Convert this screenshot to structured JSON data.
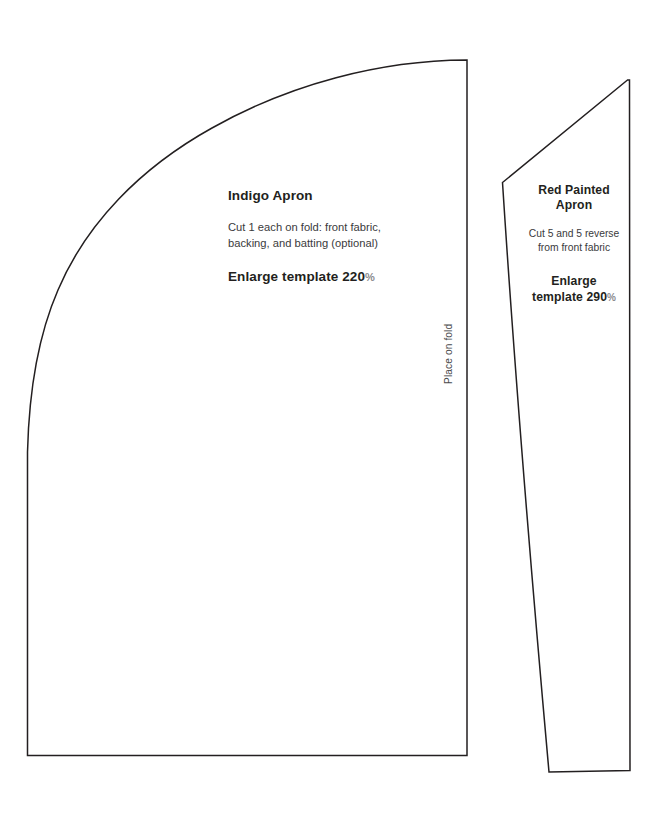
{
  "document": {
    "kind": "sewing-pattern-template-sheet",
    "background_color": "#ffffff",
    "line_color": "#231f20",
    "width": 662,
    "height": 830
  },
  "pieces": [
    {
      "id": "indigo-apron",
      "title": "Indigo Apron",
      "instructions": "Cut 1 each on fold: front fabric, backing, and batting (optional)",
      "instruction_lines": [
        "Cut 1 each on fold: front fabric,",
        "backing, and batting (optional)"
      ],
      "enlarge_label": "Enlarge template 220",
      "enlarge_percent_symbol": "%",
      "enlarge_value": "220%",
      "fold_note": "Place on fold"
    },
    {
      "id": "red-painted-apron",
      "title": "Red Painted Apron",
      "title_lines": [
        "Red Painted",
        "Apron"
      ],
      "instructions": "Cut 5 and 5 reverse from front fabric",
      "instruction_lines": [
        "Cut 5 and 5 reverse",
        "from front fabric"
      ],
      "enlarge_label_lines": [
        "Enlarge",
        "template 290"
      ],
      "enlarge_percent_symbol": "%",
      "enlarge_value": "290%"
    }
  ],
  "indigo": {
    "title": "Indigo Apron",
    "desc_line1": "Cut 1 each on fold: front fabric,",
    "desc_line2": "backing, and batting (optional)",
    "enlarge_text": "Enlarge template 220",
    "percent": "%",
    "fold_note": "Place on fold"
  },
  "red": {
    "title_line1": "Red Painted",
    "title_line2": "Apron",
    "desc_line1": "Cut 5 and 5 reverse",
    "desc_line2": "from front fabric",
    "enlarge_line1": "Enlarge",
    "enlarge_line2": "template 290",
    "percent": "%"
  }
}
